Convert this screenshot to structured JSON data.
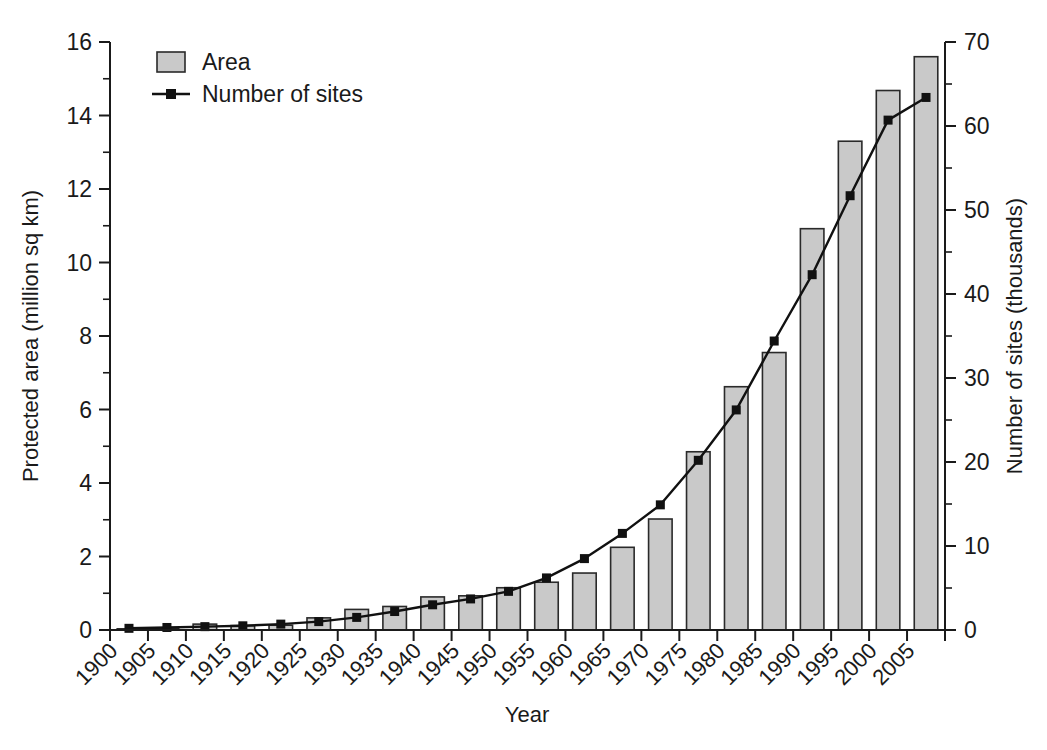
{
  "chart_data": {
    "type": "bar",
    "title": "",
    "xlabel": "Year",
    "ylabel": "Protected area (million sq km)",
    "y2label": "Number of sites (thousands)",
    "categories": [
      "1900",
      "1905",
      "1910",
      "1915",
      "1920",
      "1925",
      "1930",
      "1935",
      "1940",
      "1945",
      "1950",
      "1955",
      "1960",
      "1965",
      "1970",
      "1975",
      "1980",
      "1985",
      "1990",
      "1995",
      "2000",
      "2005"
    ],
    "ylim": [
      0,
      16
    ],
    "y2lim": [
      0,
      70
    ],
    "yticks": [
      0,
      2,
      4,
      6,
      8,
      10,
      12,
      14,
      16
    ],
    "yticklabels": [
      "0",
      "2",
      "4",
      "6",
      "8",
      "10",
      "12",
      "14",
      "16"
    ],
    "yminorticks": [
      1,
      3,
      5,
      7,
      9,
      11,
      13,
      15
    ],
    "y2ticks": [
      0,
      10,
      20,
      30,
      40,
      50,
      60,
      70
    ],
    "y2ticklabels": [
      "0",
      "10",
      "20",
      "30",
      "40",
      "50",
      "60",
      "70"
    ],
    "y2minorticks": [
      5,
      15,
      25,
      35,
      45,
      55,
      65
    ],
    "grid": false,
    "legend_position": "top-left",
    "series": [
      {
        "name": "Area",
        "type": "bar",
        "axis": "left",
        "unit": "million sq km",
        "color": "#c9c9c9",
        "edge_color": "#2a2a2a",
        "values": [
          0.02,
          0.04,
          0.16,
          0.12,
          0.13,
          0.33,
          0.56,
          0.64,
          0.9,
          0.93,
          1.15,
          1.3,
          1.55,
          2.25,
          3.02,
          4.85,
          6.62,
          7.55,
          10.92,
          13.3,
          14.68,
          15.6
        ]
      },
      {
        "name": "Number of sites",
        "type": "line",
        "axis": "right",
        "unit": "thousands",
        "color": "#111111",
        "marker": "square",
        "values": [
          0.2,
          0.3,
          0.4,
          0.5,
          0.7,
          1.0,
          1.5,
          2.2,
          3.0,
          3.7,
          4.6,
          6.2,
          8.5,
          11.5,
          14.9,
          20.2,
          26.2,
          34.4,
          42.3,
          51.7,
          60.7,
          63.4
        ]
      }
    ]
  },
  "legend": {
    "items": [
      {
        "label": "Area",
        "kind": "swatch"
      },
      {
        "label": "Number of sites",
        "kind": "line-marker"
      }
    ]
  },
  "colors": {
    "bar_fill": "#c9c9c9",
    "bar_edge": "#2a2a2a",
    "line": "#111111",
    "axis": "#1a1a1a",
    "background": "#ffffff"
  }
}
